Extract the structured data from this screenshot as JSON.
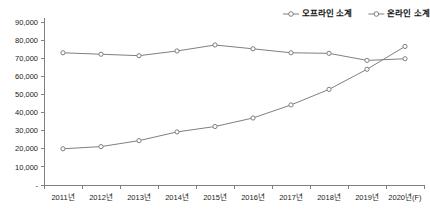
{
  "chart_data": {
    "type": "line",
    "title": "",
    "xlabel": "",
    "ylabel": "",
    "ylim": [
      0,
      90000
    ],
    "grid": false,
    "legend_position": "top-right",
    "categories": [
      "2011년",
      "2012년",
      "2013년",
      "2014년",
      "2015년",
      "2016년",
      "2017년",
      "2018년",
      "2019년",
      "2020년(F)"
    ],
    "ytick_labels": [
      "-",
      "10,000",
      "20,000",
      "30,000",
      "40,000",
      "50,000",
      "60,000",
      "70,000",
      "80,000",
      "90,000"
    ],
    "ytick_values": [
      0,
      10000,
      20000,
      30000,
      40000,
      50000,
      60000,
      70000,
      80000,
      90000
    ],
    "series": [
      {
        "name": "오프라인 소계",
        "values": [
          73000,
          72200,
          71400,
          74000,
          77300,
          75200,
          73000,
          72700,
          68800,
          69700
        ]
      },
      {
        "name": "온라인 소계",
        "values": [
          20000,
          21200,
          24500,
          29300,
          32300,
          37000,
          44200,
          52800,
          63900,
          76500
        ]
      }
    ]
  }
}
